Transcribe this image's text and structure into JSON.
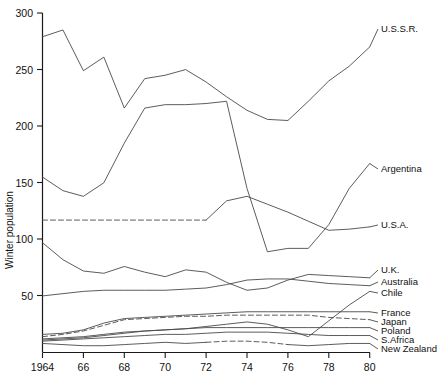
{
  "chart_data": {
    "type": "line",
    "title": "",
    "xlabel": "",
    "ylabel": "Winter population",
    "xlim": [
      1964,
      1980
    ],
    "ylim": [
      0,
      300
    ],
    "grid": false,
    "legend_position": "right-inline-labels",
    "x_tick_labels": [
      "1964",
      "66",
      "68",
      "70",
      "72",
      "74",
      "76",
      "78",
      "80"
    ],
    "x_tick_values": [
      1964,
      1966,
      1968,
      1970,
      1972,
      1974,
      1976,
      1978,
      1980
    ],
    "y_tick_labels": [
      "50",
      "100",
      "150",
      "200",
      "250",
      "300"
    ],
    "y_tick_values": [
      50,
      100,
      150,
      200,
      250,
      300
    ],
    "x": [
      1964,
      1965,
      1966,
      1967,
      1968,
      1969,
      1970,
      1971,
      1972,
      1973,
      1974,
      1975,
      1976,
      1977,
      1978,
      1979,
      1980
    ],
    "series": [
      {
        "name": "U.S.S.R.",
        "style": "solid",
        "values": [
          279,
          285,
          249,
          261,
          216,
          242,
          245,
          250,
          239,
          226,
          214,
          206,
          205,
          222,
          240,
          253,
          270
        ]
      },
      {
        "name": "Argentina",
        "style": "solid",
        "values": [
          155,
          143,
          138,
          150,
          185,
          216,
          219,
          219,
          220,
          222,
          145,
          89,
          92,
          92,
          113,
          145,
          167
        ]
      },
      {
        "name": "U.S.A.",
        "style": "dashed-then-solid",
        "dash_until": 1972,
        "values": [
          117,
          117,
          117,
          117,
          117,
          117,
          117,
          117,
          117,
          134,
          138,
          131,
          124,
          116,
          108,
          109,
          111
        ]
      },
      {
        "name": "U.K.",
        "style": "solid",
        "values": [
          97,
          82,
          72,
          70,
          76,
          71,
          67,
          73,
          71,
          62,
          55,
          57,
          64,
          69,
          68,
          67,
          66
        ]
      },
      {
        "name": "Australia",
        "style": "solid",
        "values": [
          50,
          52,
          54,
          55,
          55,
          55,
          55,
          56,
          57,
          60,
          64,
          65,
          65,
          63,
          61,
          60,
          59
        ]
      },
      {
        "name": "Chile",
        "style": "solid",
        "values": [
          12,
          13,
          14,
          16,
          18,
          19,
          20,
          21,
          23,
          25,
          27,
          25,
          20,
          14,
          28,
          42,
          54
        ]
      },
      {
        "name": "France",
        "style": "solid",
        "values": [
          16,
          17,
          20,
          26,
          30,
          31,
          32,
          33,
          34,
          35,
          36,
          36,
          36,
          36,
          36,
          36,
          36
        ]
      },
      {
        "name": "Japan",
        "style": "dashed",
        "values": [
          14,
          16,
          19,
          24,
          29,
          30,
          31,
          32,
          32,
          33,
          33,
          33,
          33,
          33,
          31,
          30,
          29
        ]
      },
      {
        "name": "Poland",
        "style": "solid",
        "values": [
          11,
          12,
          13,
          15,
          17,
          19,
          20,
          21,
          22,
          22,
          22,
          22,
          22,
          22,
          22,
          22,
          22
        ]
      },
      {
        "name": "S.Africa",
        "style": "solid",
        "values": [
          10,
          11,
          12,
          13,
          14,
          15,
          16,
          16,
          17,
          18,
          18,
          18,
          17,
          16,
          15,
          15,
          15
        ]
      },
      {
        "name": "New Zealand",
        "style": "solid-dashed-mix",
        "values": [
          8,
          7,
          6,
          6,
          7,
          8,
          9,
          8,
          9,
          10,
          10,
          9,
          7,
          6,
          7,
          8,
          8
        ]
      }
    ],
    "series_label_positions": [
      {
        "name": "U.S.S.R.",
        "x": 381,
        "y": 32
      },
      {
        "name": "Argentina",
        "x": 381,
        "y": 172
      },
      {
        "name": "U.S.A.",
        "x": 381,
        "y": 228
      },
      {
        "name": "U.K.",
        "x": 381,
        "y": 273
      },
      {
        "name": "Australia",
        "x": 381,
        "y": 285
      },
      {
        "name": "Chile",
        "x": 381,
        "y": 296
      },
      {
        "name": "France",
        "x": 381,
        "y": 316
      },
      {
        "name": "Japan",
        "x": 381,
        "y": 325
      },
      {
        "name": "Poland",
        "x": 381,
        "y": 334
      },
      {
        "name": "S.Africa",
        "x": 381,
        "y": 343
      },
      {
        "name": "New Zealand",
        "x": 381,
        "y": 352
      }
    ]
  }
}
